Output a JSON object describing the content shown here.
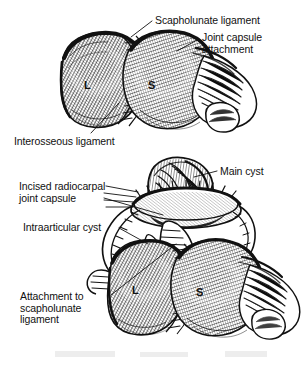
{
  "figure": {
    "width": 302,
    "height": 370,
    "background_color": "#ffffff",
    "ink_color": "#111111",
    "style": "pen-and-ink stipple / hatch medical illustration"
  },
  "panels": [
    {
      "id": "upper",
      "caption": "Intact dorsal wrist with scapholunate ligament and joint capsule attachment",
      "bone_letters": [
        {
          "letter": "L",
          "meaning": "Lunate"
        },
        {
          "letter": "S",
          "meaning": "Scaphoid"
        }
      ]
    },
    {
      "id": "lower",
      "caption": "Radiocarpal joint capsule incised, exposing main cyst and intraarticular cyst",
      "bone_letters": [
        {
          "letter": "L",
          "meaning": "Lunate"
        },
        {
          "letter": "S",
          "meaning": "Scaphoid"
        }
      ]
    }
  ],
  "labels": [
    {
      "id": "scapholunate-ligament",
      "lines": [
        "Scapholunate ligament"
      ],
      "x": 155,
      "y": 15,
      "align": "left"
    },
    {
      "id": "joint-capsule-attachment",
      "lines": [
        "Joint capsule",
        "attachment"
      ],
      "x": 202,
      "y": 32,
      "align": "left"
    },
    {
      "id": "interosseous-ligament",
      "lines": [
        "Interosseous ligament"
      ],
      "x": 14,
      "y": 136,
      "align": "left"
    },
    {
      "id": "main-cyst",
      "lines": [
        "Main cyst"
      ],
      "x": 220,
      "y": 166,
      "align": "left"
    },
    {
      "id": "incised-radiocarpal-joint-capsule",
      "lines": [
        "Incised radiocarpal",
        "joint capsule"
      ],
      "x": 19,
      "y": 181,
      "align": "left"
    },
    {
      "id": "intraarticular-cyst",
      "lines": [
        "Intraarticular cyst"
      ],
      "x": 23,
      "y": 222,
      "align": "left"
    },
    {
      "id": "attachment-to-scapholunate-ligament",
      "lines": [
        "Attachment to",
        "scapholunate",
        "ligament"
      ],
      "x": 20,
      "y": 291,
      "align": "left"
    }
  ],
  "bone_letters": [
    {
      "id": "upper-lunate",
      "text": "L",
      "x": 84,
      "y": 79
    },
    {
      "id": "upper-scaphoid",
      "text": "S",
      "x": 148,
      "y": 79
    },
    {
      "id": "lower-lunate",
      "text": "L",
      "x": 132,
      "y": 284
    },
    {
      "id": "lower-scaphoid",
      "text": "S",
      "x": 196,
      "y": 286
    }
  ],
  "leader_lines": [
    {
      "id": "leader-scapholunate-ligament",
      "from": [
        152,
        21
      ],
      "to": [
        131,
        37
      ]
    },
    {
      "id": "leader-joint-capsule-attachment",
      "from": [
        199,
        39
      ],
      "to": [
        178,
        50
      ]
    },
    {
      "id": "leader-interosseous-ligament",
      "from": [
        90,
        133
      ],
      "to": [
        118,
        104
      ]
    },
    {
      "id": "leader-main-cyst",
      "from": [
        217,
        171
      ],
      "to": [
        196,
        177
      ]
    },
    {
      "id": "leader-incised-radiocarpal",
      "from": [
        104,
        197
      ],
      "to": [
        160,
        213
      ]
    },
    {
      "id": "leader-intraarticular-cyst",
      "from": [
        118,
        228
      ],
      "to": [
        146,
        243
      ]
    },
    {
      "id": "leader-attachment-scapholunate",
      "from": [
        110,
        295
      ],
      "to": [
        174,
        245
      ]
    }
  ]
}
